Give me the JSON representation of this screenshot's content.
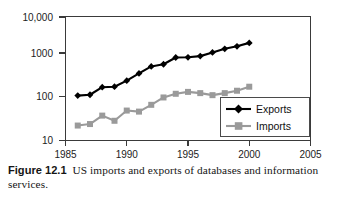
{
  "figure": {
    "number_label": "Figure 12.1",
    "caption_text": "US imports and exports of databases and information services."
  },
  "chart_data": {
    "type": "line",
    "title": "",
    "xlabel": "",
    "ylabel": "",
    "yscale": "log",
    "xlim": [
      1985,
      2005
    ],
    "ylim": [
      10,
      10000
    ],
    "grid": false,
    "legend_position": "bottom-right",
    "x_tick_labels": [
      "1985",
      "1990",
      "1995",
      "2000",
      "2005"
    ],
    "x_ticks": [
      1985,
      1990,
      1995,
      2000,
      2005
    ],
    "y_tick_labels": [
      "10,000",
      "1000",
      "100",
      "10"
    ],
    "y_ticks": [
      10000,
      1000,
      100,
      10
    ],
    "x": [
      1986,
      1987,
      1988,
      1989,
      1990,
      1991,
      1992,
      1993,
      1994,
      1995,
      1996,
      1997,
      1998,
      1999,
      2000
    ],
    "series": [
      {
        "name": "Exports",
        "color": "#000000",
        "marker": "diamond",
        "values": [
          122,
          128,
          195,
          200,
          280,
          420,
          620,
          700,
          1020,
          1030,
          1100,
          1350,
          1650,
          1900,
          2300
        ]
      },
      {
        "name": "Imports",
        "color": "#9a9a9a",
        "marker": "square",
        "values": [
          23,
          25,
          40,
          30,
          53,
          50,
          73,
          110,
          135,
          150,
          140,
          125,
          140,
          160,
          200
        ]
      }
    ]
  },
  "legend": {
    "entries": [
      {
        "label": "Exports"
      },
      {
        "label": "Imports"
      }
    ]
  }
}
